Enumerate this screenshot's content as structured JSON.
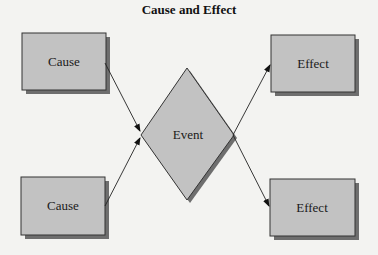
{
  "title": "Cause and Effect",
  "nodes": {
    "cause_top": {
      "label": "Cause"
    },
    "cause_bottom": {
      "label": "Cause"
    },
    "event": {
      "label": "Event"
    },
    "effect_top": {
      "label": "Effect"
    },
    "effect_bottom": {
      "label": "Effect"
    }
  },
  "edges": [
    {
      "from": "cause_top",
      "to": "event"
    },
    {
      "from": "cause_bottom",
      "to": "event"
    },
    {
      "from": "event",
      "to": "effect_top"
    },
    {
      "from": "event",
      "to": "effect_bottom"
    }
  ],
  "colors": {
    "box_fill": "#c2c2c2",
    "shadow": "#6e6e6e",
    "border": "#333333",
    "background": "#f3f3f1"
  }
}
